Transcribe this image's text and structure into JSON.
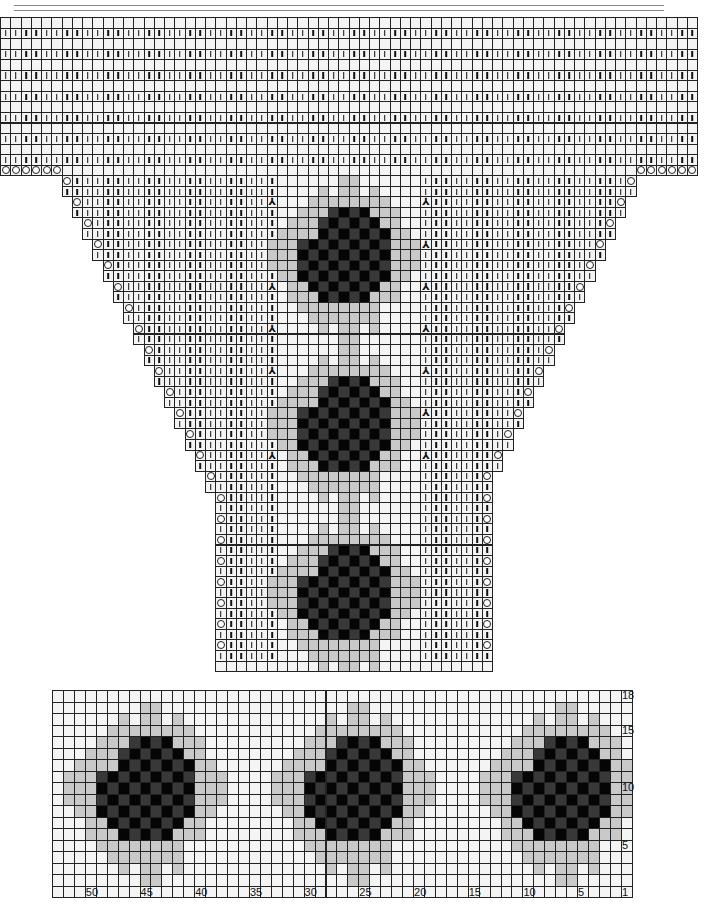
{
  "header_rules": [
    {
      "x": 14,
      "y": 5,
      "w": 650
    },
    {
      "x": 14,
      "y": 10,
      "w": 650
    }
  ],
  "legend_symbols": {
    "k": "knit (vertical bar)",
    "o": "yarn over (circle)",
    "lam": "decrease (λ)",
    "blank": "purl / empty",
    "g": "light gray contrast",
    "b": "dark contrast"
  },
  "colors": {
    "grid": "#222222",
    "cell": "#f4f4f4",
    "gray": "#c9c9c9",
    "dark": "#050505",
    "dark_alt": "#383838"
  },
  "top_chart": {
    "origin_x": 0,
    "origin_y": 17,
    "cell_w": 10.25,
    "cell_h": 10.55,
    "cols": 68,
    "band_rows": 15,
    "funnel": {
      "center_blank_from": 27,
      "center_blank_to": 40,
      "lambda_left_col": 26,
      "lambda_right_col": 41,
      "rows": 47,
      "bottom_start": 21,
      "bottom_end": 47
    },
    "flowers": [
      {
        "row": 18,
        "col": 28
      },
      {
        "row": 34,
        "col": 28
      },
      {
        "row": 50,
        "col": 28
      }
    ]
  },
  "bottom_chart": {
    "origin_x": 52,
    "origin_y": 690,
    "cell_w": 10.94,
    "cell_h": 11.5,
    "cols": 53,
    "rows": 18,
    "flowers": [
      {
        "col": 1
      },
      {
        "col": 20
      },
      {
        "col": 39
      }
    ],
    "row_labels": [
      {
        "row": 18,
        "text": "18"
      },
      {
        "row": 15,
        "text": "15"
      },
      {
        "row": 10,
        "text": "10"
      },
      {
        "row": 5,
        "text": "5"
      }
    ],
    "col_labels": [
      {
        "col": 50,
        "text": "50"
      },
      {
        "col": 45,
        "text": "45"
      },
      {
        "col": 40,
        "text": "40"
      },
      {
        "col": 35,
        "text": "35"
      },
      {
        "col": 30,
        "text": "30"
      },
      {
        "col": 25,
        "text": "25"
      },
      {
        "col": 20,
        "text": "20"
      },
      {
        "col": 15,
        "text": "15"
      },
      {
        "col": 10,
        "text": "10"
      },
      {
        "col": 5,
        "text": "5"
      },
      {
        "col": 1,
        "text": "1"
      }
    ]
  },
  "flower_motif": {
    "note": "16 rows x 15 cols; '.'=none, 'g'=gray, 'b'=dark",
    "rows": [
      ".......gg......",
      ".....g.gg.g....",
      "....gggggggg...",
      "...gggbbbbggg..",
      "..gggbbbbbbgg..",
      ".ggggbbbbbbbgg.",
      "gggbbbbbbbbbggg",
      "gggbbbbbbbbbggg",
      "gggbbbbbbbbbggg",
      ".ggbbbbbbbbbgg.",
      "..ggbbbbbbbgg..",
      "..gggbbbbbggg..",
      "...gggggggg....",
      "....ggggggg....",
      ".....g.gg.g....",
      ".......gg......"
    ]
  }
}
